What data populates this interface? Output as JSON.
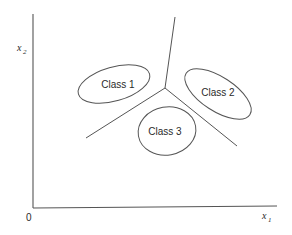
{
  "diagram": {
    "type": "decision-regions",
    "axes": {
      "origin_label": "0",
      "x_label": "x",
      "x_subscript": "1",
      "y_label": "x",
      "y_subscript": "2"
    },
    "classes": [
      {
        "label": "Class 1"
      },
      {
        "label": "Class 2"
      },
      {
        "label": "Class 3"
      }
    ],
    "boundaries": [
      {
        "name": "boundary-1-2",
        "from": [
          165,
          88
        ],
        "to": [
          175,
          17
        ]
      },
      {
        "name": "boundary-1-3",
        "from": [
          165,
          88
        ],
        "to": [
          86,
          138
        ]
      },
      {
        "name": "boundary-2-3",
        "from": [
          165,
          88
        ],
        "to": [
          237,
          146
        ]
      }
    ],
    "colors": {
      "line": "#555555",
      "text": "#2a2a2a",
      "background": "#ffffff"
    }
  }
}
